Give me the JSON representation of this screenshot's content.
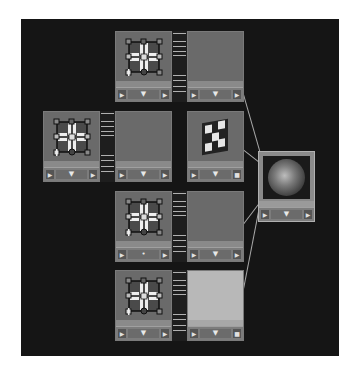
{
  "canvas": {
    "background": "#151515"
  },
  "nodes": [
    {
      "id": "row1-pattern",
      "type": "pattern-node",
      "bar": {
        "left": "▶",
        "mid": "▼",
        "right": "▶"
      }
    },
    {
      "id": "row1-output",
      "type": "color-panel",
      "bar": {
        "left": "▶",
        "mid": "▼",
        "right": "▶"
      }
    },
    {
      "id": "row2-pattern",
      "type": "pattern-node",
      "bar": {
        "left": "▶",
        "mid": "▼",
        "right": "▶"
      }
    },
    {
      "id": "row2-output",
      "type": "color-panel",
      "bar": {
        "left": "▶",
        "mid": "▼",
        "right": "▶"
      }
    },
    {
      "id": "row2-checker",
      "type": "checker-node",
      "bar": {
        "left": "▶",
        "mid": "▼",
        "right": "■"
      }
    },
    {
      "id": "row3-pattern",
      "type": "pattern-node",
      "bar": {
        "left": "▶",
        "mid": "•",
        "right": "▶"
      }
    },
    {
      "id": "row3-output",
      "type": "color-panel",
      "bar": {
        "left": "▶",
        "mid": "▼",
        "right": "▶"
      }
    },
    {
      "id": "row4-pattern",
      "type": "pattern-node",
      "bar": {
        "left": "▶",
        "mid": "▼",
        "right": "▶"
      }
    },
    {
      "id": "row4-output",
      "type": "color-panel-light",
      "bar": {
        "left": "▶",
        "mid": "▼",
        "right": "■"
      }
    },
    {
      "id": "material-sphere",
      "type": "material-preview",
      "bar": {
        "left": "▶",
        "mid": "▼",
        "right": "▶"
      }
    }
  ],
  "icons": {
    "pattern": "tile-pattern-icon",
    "checker": "checker-icon",
    "sphere": "sphere-preview-icon",
    "arrow_right": "▶",
    "arrow_down": "▼"
  },
  "colors": {
    "node_body": "#6a6a6a",
    "node_light": "#b8b8b8",
    "wire": "#a8a8a8"
  }
}
